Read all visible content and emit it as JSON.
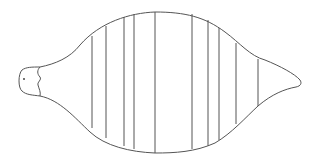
{
  "figure": {
    "stroke_color": "#555555",
    "background": "#ffffff",
    "segment_lines_x": [
      92,
      106,
      124,
      134,
      155,
      192,
      208,
      219,
      236,
      258
    ],
    "segment_count": 10
  }
}
